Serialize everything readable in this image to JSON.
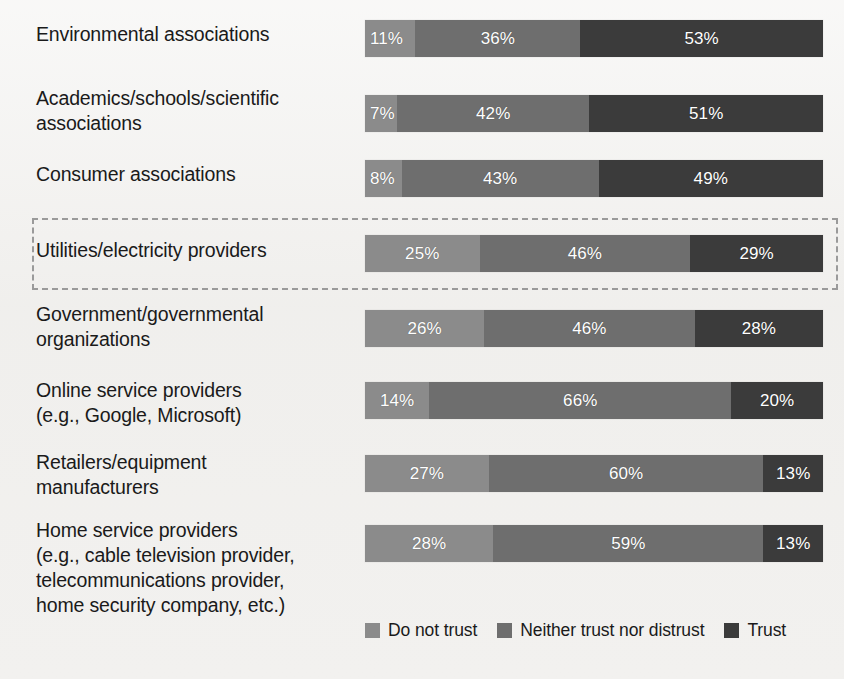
{
  "chart_data": {
    "type": "bar",
    "subtype": "stacked-horizontal-100percent",
    "title": "",
    "xlabel": "",
    "ylabel": "",
    "xlim": [
      0,
      100
    ],
    "grid": false,
    "legend_position": "bottom-right",
    "value_suffix": "%",
    "categories": [
      "Environmental associations",
      "Academics/schools/scientific associations",
      "Consumer associations",
      "Utilities/electricity providers",
      "Government/governmental organizations",
      "Online service providers (e.g., Google, Microsoft)",
      "Retailers/equipment manufacturers",
      "Home service providers (e.g., cable television provider, telecommunications provider, home security company, etc.)"
    ],
    "series": [
      {
        "name": "Do not trust",
        "color": "#8b8b8b",
        "values": [
          11,
          7,
          8,
          25,
          26,
          14,
          27,
          28
        ]
      },
      {
        "name": "Neither trust nor distrust",
        "color": "#6e6e6e",
        "values": [
          36,
          42,
          43,
          46,
          46,
          66,
          60,
          59
        ]
      },
      {
        "name": "Trust",
        "color": "#3b3b3b",
        "values": [
          53,
          51,
          49,
          29,
          28,
          20,
          13,
          13
        ]
      }
    ],
    "annotations": [
      {
        "type": "dashed-highlight-box",
        "target_category": "Utilities/electricity providers"
      }
    ]
  },
  "rows": [
    {
      "label": "Environmental associations",
      "label_lines": "Environmental associations",
      "segments": [
        {
          "label": "11%",
          "value": 11,
          "series": "Do not trust"
        },
        {
          "label": "36%",
          "value": 36,
          "series": "Neither trust nor distrust"
        },
        {
          "label": "53%",
          "value": 53,
          "series": "Trust"
        }
      ]
    },
    {
      "label": "Academics/schools/scientific associations",
      "label_lines": "Academics/schools/scientific\nassociations",
      "segments": [
        {
          "label": "7%",
          "value": 7,
          "series": "Do not trust"
        },
        {
          "label": "42%",
          "value": 42,
          "series": "Neither trust nor distrust"
        },
        {
          "label": "51%",
          "value": 51,
          "series": "Trust"
        }
      ]
    },
    {
      "label": "Consumer associations",
      "label_lines": "Consumer associations",
      "segments": [
        {
          "label": "8%",
          "value": 8,
          "series": "Do not trust"
        },
        {
          "label": "43%",
          "value": 43,
          "series": "Neither trust nor distrust"
        },
        {
          "label": "49%",
          "value": 49,
          "series": "Trust"
        }
      ]
    },
    {
      "label": "Utilities/electricity providers",
      "label_lines": "Utilities/electricity providers",
      "segments": [
        {
          "label": "25%",
          "value": 25,
          "series": "Do not trust"
        },
        {
          "label": "46%",
          "value": 46,
          "series": "Neither trust nor distrust"
        },
        {
          "label": "29%",
          "value": 29,
          "series": "Trust"
        }
      ]
    },
    {
      "label": "Government/governmental organizations",
      "label_lines": "Government/governmental\norganizations",
      "segments": [
        {
          "label": "26%",
          "value": 26,
          "series": "Do not trust"
        },
        {
          "label": "46%",
          "value": 46,
          "series": "Neither trust nor distrust"
        },
        {
          "label": "28%",
          "value": 28,
          "series": "Trust"
        }
      ]
    },
    {
      "label": "Online service providers (e.g., Google, Microsoft)",
      "label_lines": "Online service providers\n(e.g., Google, Microsoft)",
      "segments": [
        {
          "label": "14%",
          "value": 14,
          "series": "Do not trust"
        },
        {
          "label": "66%",
          "value": 66,
          "series": "Neither trust nor distrust"
        },
        {
          "label": "20%",
          "value": 20,
          "series": "Trust"
        }
      ]
    },
    {
      "label": "Retailers/equipment manufacturers",
      "label_lines": "Retailers/equipment\nmanufacturers",
      "segments": [
        {
          "label": "27%",
          "value": 27,
          "series": "Do not trust"
        },
        {
          "label": "60%",
          "value": 60,
          "series": "Neither trust nor distrust"
        },
        {
          "label": "13%",
          "value": 13,
          "series": "Trust"
        }
      ]
    },
    {
      "label": "Home service providers (e.g., cable television provider, telecommunications provider, home security company, etc.)",
      "label_lines": "Home service providers\n(e.g., cable television provider,\ntelecommunications provider,\nhome security company, etc.)",
      "segments": [
        {
          "label": "28%",
          "value": 28,
          "series": "Do not trust"
        },
        {
          "label": "59%",
          "value": 59,
          "series": "Neither trust nor distrust"
        },
        {
          "label": "13%",
          "value": 13,
          "series": "Trust"
        }
      ]
    }
  ],
  "legend": {
    "items": [
      {
        "label": "Do not trust",
        "color": "#8b8b8b"
      },
      {
        "label": "Neither trust nor distrust",
        "color": "#6e6e6e"
      },
      {
        "label": "Trust",
        "color": "#3b3b3b"
      }
    ]
  },
  "layout": {
    "bar_left": 365,
    "bar_width": 458,
    "bar_height": 37,
    "row_tops": [
      20,
      95,
      160,
      235,
      310,
      382,
      455,
      525
    ],
    "label_tops": [
      22,
      86,
      162,
      238,
      302,
      378,
      450,
      518
    ],
    "highlight_box": {
      "left": 32,
      "top": 218,
      "width": 806,
      "height": 72
    },
    "legend_top": 620,
    "legend_left": 365
  }
}
